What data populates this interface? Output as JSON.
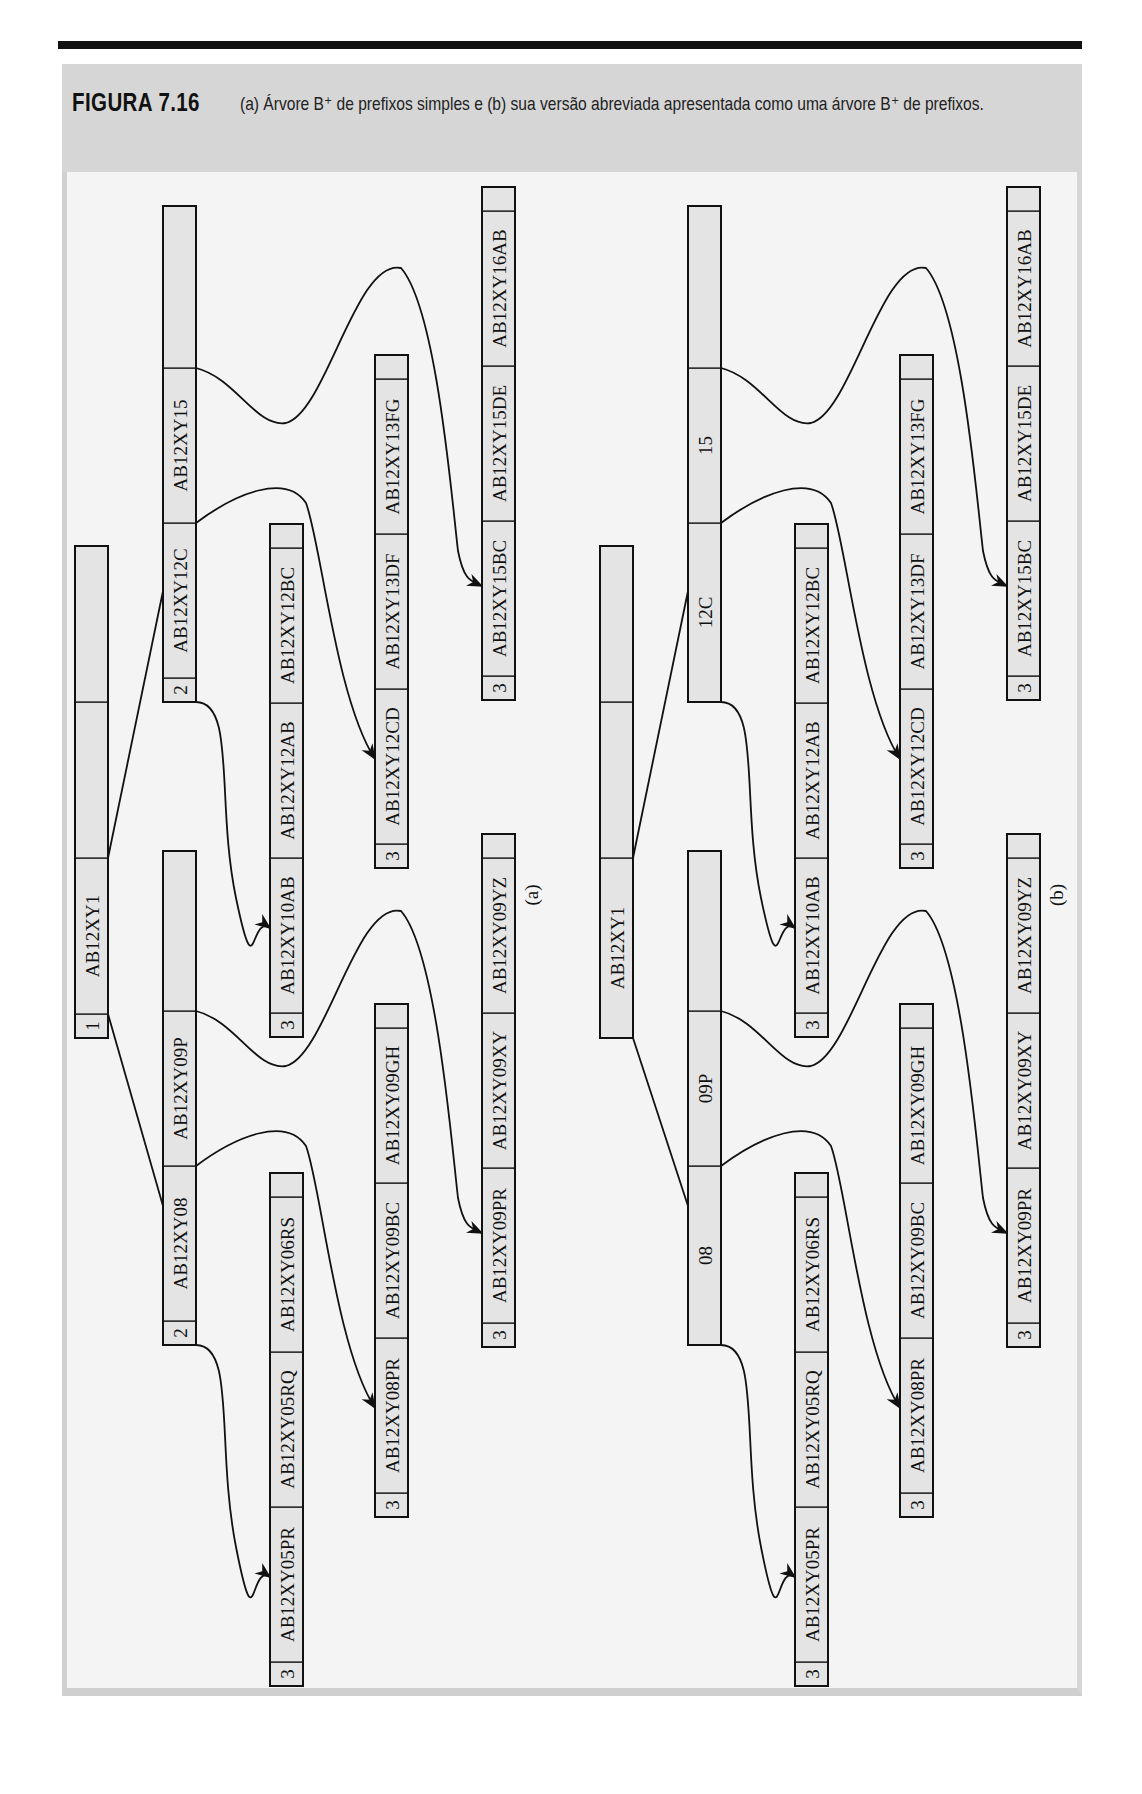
{
  "figure": {
    "label": "FIGURA 7.16",
    "caption": "(a) Árvore B⁺ de prefixos simples e (b) sua versão abreviada apresentada como uma árvore B⁺ de prefixos."
  },
  "trees": [
    {
      "id": "a",
      "sublabel": "(a)",
      "root": {
        "count": "1",
        "keys": [
          "AB12XY1",
          "",
          ""
        ]
      },
      "index_nodes": [
        {
          "count": "2",
          "keys": [
            "AB12XY08",
            "AB12XY09P",
            ""
          ]
        },
        {
          "count": "2",
          "keys": [
            "AB12XY12C",
            "AB12XY15",
            ""
          ]
        }
      ],
      "leaves": [
        {
          "count": "3",
          "keys": [
            "AB12XY05PR",
            "AB12XY05RQ",
            "AB12XY06RS",
            ""
          ]
        },
        {
          "count": "3",
          "keys": [
            "AB12XY08PR",
            "AB12XY09BC",
            "AB12XY09GH",
            ""
          ]
        },
        {
          "count": "3",
          "keys": [
            "AB12XY09PR",
            "AB12XY09XY",
            "AB12XY09YZ",
            ""
          ]
        },
        {
          "count": "3",
          "keys": [
            "AB12XY10AB",
            "AB12XY12AB",
            "AB12XY12BC",
            ""
          ]
        },
        {
          "count": "3",
          "keys": [
            "AB12XY12CD",
            "AB12XY13DF",
            "AB12XY13FG",
            ""
          ]
        },
        {
          "count": "3",
          "keys": [
            "AB12XY15BC",
            "AB12XY15DE",
            "AB12XY16AB",
            ""
          ]
        }
      ]
    },
    {
      "id": "b",
      "sublabel": "(b)",
      "root": {
        "count": "",
        "keys": [
          "AB12XY1",
          "",
          ""
        ]
      },
      "index_nodes": [
        {
          "count": "",
          "keys": [
            "08",
            "09P",
            ""
          ]
        },
        {
          "count": "",
          "keys": [
            "12C",
            "15",
            ""
          ]
        }
      ],
      "leaves": [
        {
          "count": "3",
          "keys": [
            "AB12XY05PR",
            "AB12XY05RQ",
            "AB12XY06RS",
            ""
          ]
        },
        {
          "count": "3",
          "keys": [
            "AB12XY08PR",
            "AB12XY09BC",
            "AB12XY09GH",
            ""
          ]
        },
        {
          "count": "3",
          "keys": [
            "AB12XY09PR",
            "AB12XY09XY",
            "AB12XY09YZ",
            ""
          ]
        },
        {
          "count": "3",
          "keys": [
            "AB12XY10AB",
            "AB12XY12AB",
            "AB12XY12BC",
            ""
          ]
        },
        {
          "count": "3",
          "keys": [
            "AB12XY12CD",
            "AB12XY13DF",
            "AB12XY13FG",
            ""
          ]
        },
        {
          "count": "3",
          "keys": [
            "AB12XY15BC",
            "AB12XY15DE",
            "AB12XY16AB",
            ""
          ]
        }
      ]
    }
  ],
  "colors": {
    "cell_fill": "#e4e4e4",
    "header_band": "#d6d6d6",
    "panel_bg": "#f4f4f4",
    "ink": "#111111"
  }
}
